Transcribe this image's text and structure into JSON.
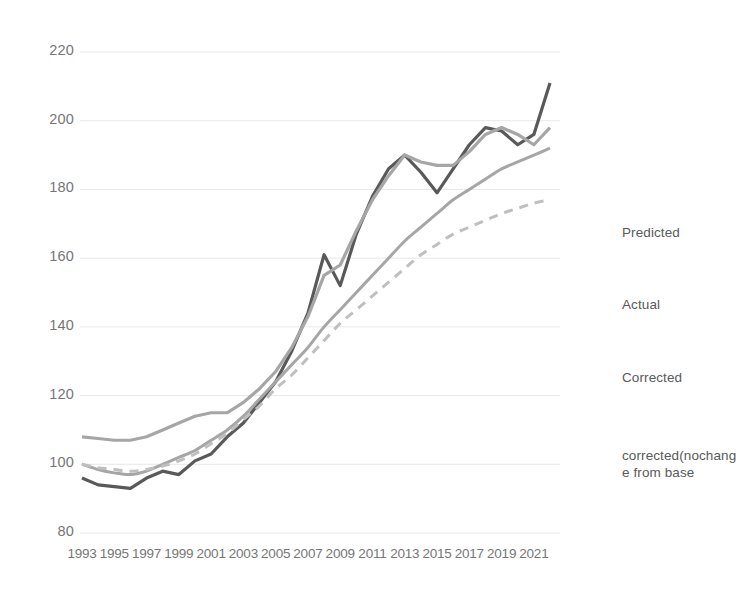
{
  "chart_data": {
    "type": "line",
    "title": "",
    "xlabel": "",
    "ylabel": "",
    "ylim": [
      80,
      220
    ],
    "ytick_step": 20,
    "yticks": [
      220,
      200,
      180,
      160,
      140,
      120,
      100,
      80
    ],
    "grid": true,
    "legend_position": "right",
    "x": [
      1993,
      1994,
      1995,
      1996,
      1997,
      1998,
      1999,
      2000,
      2001,
      2002,
      2003,
      2004,
      2005,
      2006,
      2007,
      2008,
      2009,
      2010,
      2011,
      2012,
      2013,
      2014,
      2015,
      2016,
      2017,
      2018,
      2019,
      2020,
      2021,
      2022
    ],
    "xticks": [
      1993,
      1995,
      1997,
      1999,
      2001,
      2003,
      2005,
      2007,
      2009,
      2011,
      2013,
      2015,
      2017,
      2019,
      2021
    ],
    "xtick_labels": [
      "1993",
      "1995",
      "1997",
      "1999",
      "2001",
      "2003",
      "2005",
      "2007",
      "2009",
      "2011",
      "2013",
      "2015",
      "2017",
      "2019",
      "2021"
    ],
    "series": [
      {
        "name": "Predicted",
        "color": "#595959",
        "width": 3.2,
        "dash": "none",
        "values": [
          96,
          94,
          93.5,
          93,
          96,
          98,
          97,
          101,
          103,
          108,
          112,
          118,
          124,
          133,
          144,
          161,
          152,
          167,
          178,
          186,
          190,
          185,
          179,
          186,
          193,
          198,
          197,
          193,
          196,
          211
        ]
      },
      {
        "name": "Actual",
        "color": "#a6a6a6",
        "width": 3.2,
        "dash": "none",
        "values": [
          108,
          107.5,
          107,
          107,
          108,
          110,
          112,
          114,
          115,
          115,
          118,
          122,
          127,
          134,
          143,
          155,
          158,
          168,
          177,
          184,
          190,
          188,
          187,
          187,
          191,
          196,
          198,
          196,
          193,
          198
        ]
      },
      {
        "name": "Corrected",
        "color": "#a6a6a6",
        "width": 3.0,
        "dash": "none",
        "values": [
          100,
          98.5,
          97.5,
          97,
          98,
          100,
          102,
          104,
          107,
          110,
          114,
          119,
          124,
          129,
          134,
          140,
          145,
          150,
          155,
          160,
          165,
          169,
          173,
          177,
          180,
          183,
          186,
          188,
          190,
          192
        ]
      },
      {
        "name": "corrected(nochange from base",
        "color": "#bfbfbf",
        "width": 3.0,
        "dash": "9 7",
        "values": [
          100,
          99,
          98.5,
          98,
          98.5,
          99.5,
          101,
          103,
          106,
          109,
          113,
          117,
          122,
          126,
          131,
          136,
          141,
          145,
          149,
          153,
          157,
          161,
          164,
          167,
          169,
          171,
          173,
          174.5,
          176,
          177
        ]
      }
    ]
  },
  "legend": {
    "items": [
      {
        "label": "Predicted",
        "color": "#595959",
        "dash": "none"
      },
      {
        "label": "Actual",
        "color": "#a6a6a6",
        "dash": "none"
      },
      {
        "label": "Corrected",
        "color": "#a6a6a6",
        "dash": "none"
      },
      {
        "label": "corrected(nochang\ne from base",
        "color": "#bfbfbf",
        "dash": "dashed"
      }
    ]
  },
  "axes": {
    "gridline_color": "#e8e8e8",
    "tick_label_color": "#767676"
  }
}
